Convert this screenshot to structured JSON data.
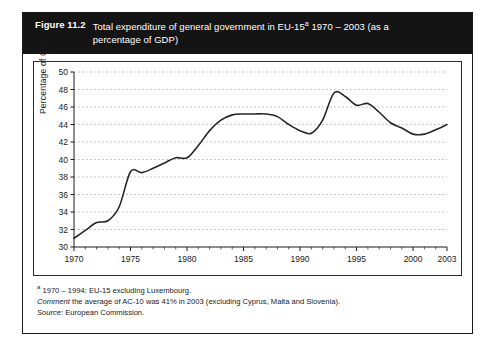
{
  "figure": {
    "number": "Figure 11.2",
    "title_line1": "Total expenditure of general government in EU-15",
    "title_superscript": "a",
    "title_line1b": " 1970 – 2003 (as a",
    "title_line2": "percentage of GDP)"
  },
  "notes": {
    "footnote_marker": "a",
    "footnote_text": " 1970 – 1994: EU-15 excluding Luxembourg.",
    "comment_label": "Comment",
    "comment_text": " the average of AC-10 was 41% in 2003 (excluding Cyprus, Malta and Slovenia).",
    "source_label": "Source:",
    "source_text": " European Commission."
  },
  "chart_data": {
    "type": "line",
    "xlabel": "",
    "ylabel": "Percentage of GDP",
    "xlim": [
      1970,
      2003
    ],
    "ylim": [
      30,
      50
    ],
    "ytick_step": 2,
    "yticks": [
      30,
      32,
      34,
      36,
      38,
      40,
      42,
      44,
      46,
      48,
      50
    ],
    "xticks": [
      1970,
      1975,
      1980,
      1985,
      1990,
      1995,
      2000,
      2003
    ],
    "xtick_labels": [
      "1970",
      "1975",
      "1980",
      "1985",
      "1990",
      "1995",
      "2000",
      "2003"
    ],
    "grid": "horizontal-dashed",
    "legend": "none",
    "line_color": "#262626",
    "series": [
      {
        "name": "Total expenditure of general government in EU-15",
        "x": [
          1970,
          1971,
          1972,
          1973,
          1974,
          1975,
          1976,
          1977,
          1978,
          1979,
          1980,
          1981,
          1982,
          1983,
          1984,
          1985,
          1986,
          1987,
          1988,
          1989,
          1990,
          1991,
          1992,
          1993,
          1994,
          1995,
          1996,
          1997,
          1998,
          1999,
          2000,
          2001,
          2002,
          2003
        ],
        "values": [
          31.0,
          31.9,
          32.8,
          33.0,
          34.6,
          38.6,
          38.5,
          39.0,
          39.6,
          40.2,
          40.2,
          41.6,
          43.3,
          44.5,
          45.1,
          45.2,
          45.2,
          45.2,
          44.9,
          44.0,
          43.3,
          43.0,
          44.5,
          47.6,
          47.2,
          46.2,
          46.4,
          45.4,
          44.2,
          43.6,
          42.9,
          42.9,
          43.4,
          44.0
        ]
      }
    ]
  }
}
